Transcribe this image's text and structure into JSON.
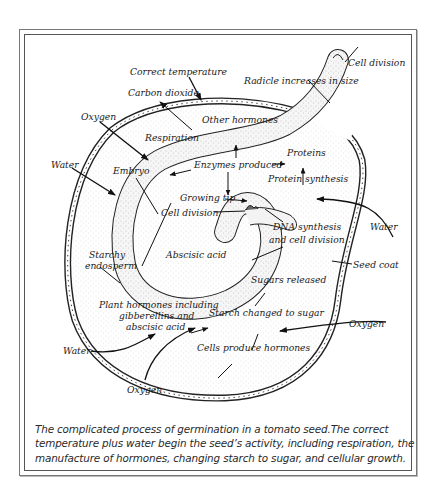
{
  "diagram": {
    "title": "Germination in a tomato seed",
    "labels": {
      "correct_temperature": "Correct temperature",
      "carbon_dioxide": "Carbon dioxide",
      "radicle_increases": "Radicle increases in size",
      "cell_division_top": "Cell division",
      "oxygen_top_left": "Oxygen",
      "other_hormones": "Other hormones",
      "respiration": "Respiration",
      "water_left": "Water",
      "embryo": "Embryo",
      "enzymes_produced": "Enzymes produced",
      "proteins": "Proteins",
      "protein_synthesis": "Protein synthesis",
      "growing_tip": "Growing tip",
      "cell_division_mid": "Cell division",
      "water_right": "Water",
      "dna_synthesis_1": "DNA synthesis",
      "dna_synthesis_2": "and cell division",
      "starchy_1": "Starchy",
      "starchy_2": "endosperm",
      "abscisic_acid": "Abscisic acid",
      "seed_coat": "Seed coat",
      "sugars_released": "Sugars released",
      "plant_hormones_1": "Plant hormones including",
      "plant_hormones_2": "gibberellins and",
      "plant_hormones_3": "abscisic acid",
      "starch_changed": "Starch changed to sugar",
      "oxygen_right": "Oxygen",
      "water_bottom_left": "Water",
      "cells_produce": "Cells produce hormones",
      "oxygen_bottom": "Oxygen"
    }
  },
  "caption": {
    "line1": "The complicated process of germination in a tomato seed.The correct",
    "line2": "temperature plus water begin the seed’s activity, including respiration, the",
    "line3": "manufacture of hormones, changing starch to sugar, and cellular growth."
  },
  "colors": {
    "ink": "#1a1a1a",
    "frame": "#555555",
    "stipple": "#9a9a9a"
  }
}
